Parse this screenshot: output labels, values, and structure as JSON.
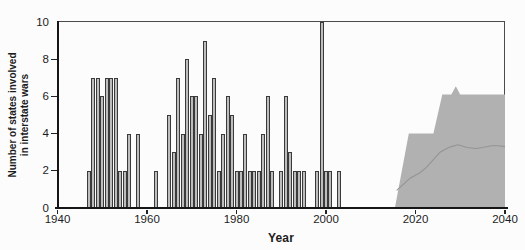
{
  "figure": {
    "background": "#fcfcfc",
    "text_color": "#1c1c1c",
    "axis_color": "#161616",
    "frame_color": "#4a4a4a",
    "bar_fill": "#bdbdbd",
    "bar_outline": "#3a3a3a",
    "area_fill": "#b1b1b1",
    "forecast_line_color": "#949494"
  },
  "chart_data": {
    "type": "bar",
    "title": "",
    "xlabel": "Year",
    "ylabel": "Number of states involved in interstate wars",
    "ylabel_lines": [
      "Number of states involved",
      "in interstate wars"
    ],
    "xlim": [
      1940,
      2040
    ],
    "ylim": [
      0,
      10
    ],
    "x_ticks": [
      1940,
      1960,
      1980,
      2000,
      2020,
      2040
    ],
    "y_ticks": [
      0,
      2,
      4,
      6,
      8,
      10
    ],
    "grid": false,
    "legend": null,
    "series": [
      {
        "name": "states-involved-in-interstate-wars",
        "type": "bar",
        "points": [
          [
            1947,
            2
          ],
          [
            1948,
            7
          ],
          [
            1949,
            7
          ],
          [
            1950,
            6
          ],
          [
            1951,
            7
          ],
          [
            1952,
            7
          ],
          [
            1953,
            7
          ],
          [
            1954,
            2
          ],
          [
            1955,
            2
          ],
          [
            1956,
            4
          ],
          [
            1958,
            4
          ],
          [
            1962,
            2
          ],
          [
            1965,
            5
          ],
          [
            1966,
            3
          ],
          [
            1967,
            7
          ],
          [
            1968,
            4
          ],
          [
            1969,
            8
          ],
          [
            1970,
            6
          ],
          [
            1971,
            6
          ],
          [
            1972,
            4
          ],
          [
            1973,
            9
          ],
          [
            1974,
            5
          ],
          [
            1975,
            7
          ],
          [
            1976,
            2
          ],
          [
            1977,
            4
          ],
          [
            1978,
            6
          ],
          [
            1979,
            5
          ],
          [
            1980,
            2
          ],
          [
            1981,
            2
          ],
          [
            1982,
            4
          ],
          [
            1983,
            2
          ],
          [
            1984,
            2
          ],
          [
            1985,
            2
          ],
          [
            1986,
            4
          ],
          [
            1987,
            6
          ],
          [
            1988,
            2
          ],
          [
            1990,
            2
          ],
          [
            1991,
            6
          ],
          [
            1992,
            3
          ],
          [
            1993,
            2
          ],
          [
            1994,
            2
          ],
          [
            1995,
            2
          ],
          [
            1998,
            2
          ],
          [
            1999,
            10
          ],
          [
            2000,
            2
          ],
          [
            2001,
            2
          ],
          [
            2003,
            2
          ]
        ]
      },
      {
        "name": "projection-envelope-area",
        "type": "area",
        "points": [
          [
            2015.4,
            0
          ],
          [
            2018.5,
            4
          ],
          [
            2024,
            4
          ],
          [
            2026,
            6.1
          ],
          [
            2028,
            6.1
          ],
          [
            2029,
            6.55
          ],
          [
            2030,
            6.1
          ],
          [
            2040,
            6.1
          ],
          [
            2040,
            0
          ]
        ]
      },
      {
        "name": "projection-line",
        "type": "line",
        "points": [
          [
            2015.8,
            0.95
          ],
          [
            2018.8,
            1.6
          ],
          [
            2021,
            1.9
          ],
          [
            2022.5,
            2.2
          ],
          [
            2024,
            2.6
          ],
          [
            2025.5,
            3.0
          ],
          [
            2027,
            3.2
          ],
          [
            2028,
            3.3
          ],
          [
            2029.5,
            3.4
          ],
          [
            2031.5,
            3.25
          ],
          [
            2033.5,
            3.2
          ],
          [
            2035,
            3.25
          ],
          [
            2037,
            3.35
          ],
          [
            2038.5,
            3.35
          ],
          [
            2040,
            3.3
          ]
        ]
      }
    ]
  }
}
